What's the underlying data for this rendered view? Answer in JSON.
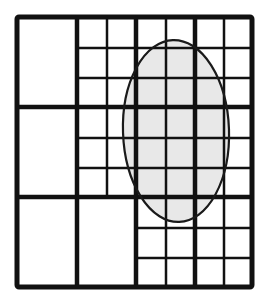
{
  "diagram": {
    "colors": {
      "background": "#ffffff",
      "line": "#111111",
      "ellipse_fill": "#e8e8e8",
      "ellipse_stroke": "#1a1a1a"
    },
    "outer_border": {
      "x": 17,
      "y": 17,
      "width": 235,
      "height": 270
    },
    "major_vertical_lines_x": [
      77,
      136,
      195
    ],
    "major_horizontal_lines_y": [
      107,
      197
    ],
    "major_blocks": [
      {
        "row": 0,
        "col": 0,
        "subdivided": false
      },
      {
        "row": 0,
        "col": 1,
        "subdivided": true,
        "grid": "2x3"
      },
      {
        "row": 0,
        "col": 2,
        "subdivided": true,
        "grid": "4x3"
      },
      {
        "row": 1,
        "col": 0,
        "subdivided": false
      },
      {
        "row": 1,
        "col": 1,
        "subdivided": true,
        "grid": "2x3"
      },
      {
        "row": 1,
        "col": 2,
        "subdivided": true,
        "grid": "4x3"
      },
      {
        "row": 2,
        "col": 0,
        "subdivided": false
      },
      {
        "row": 2,
        "col": 1,
        "subdivided": false
      },
      {
        "row": 2,
        "col": 2,
        "subdivided": true,
        "grid": "4x3"
      }
    ],
    "thin_vertical_lines": [
      {
        "x": 107,
        "y1": 17,
        "y2": 197
      },
      {
        "x": 166,
        "y1": 17,
        "y2": 287
      },
      {
        "x": 224,
        "y1": 17,
        "y2": 287
      }
    ],
    "thin_horizontal_lines": [
      {
        "y": 48,
        "x1": 77,
        "x2": 252
      },
      {
        "y": 78,
        "x1": 77,
        "x2": 252
      },
      {
        "y": 138,
        "x1": 77,
        "x2": 252
      },
      {
        "y": 168,
        "x1": 77,
        "x2": 252
      },
      {
        "y": 228,
        "x1": 136,
        "x2": 252
      },
      {
        "y": 258,
        "x1": 136,
        "x2": 252
      }
    ],
    "ellipse": {
      "cx": 176,
      "cy": 131,
      "rx": 53,
      "ry": 91
    }
  }
}
